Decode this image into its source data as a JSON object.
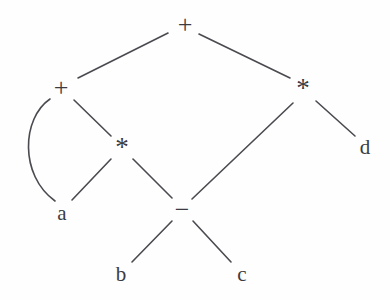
{
  "figure": {
    "background_color": "#fefefe",
    "edge_color": "#4a4a50",
    "label_color": "#3b3b42",
    "width": 390,
    "height": 300
  },
  "graph": {
    "type": "dag",
    "nodes": [
      {
        "id": "plus-root",
        "label": "+",
        "kind": "operator",
        "x": 185,
        "y": 25
      },
      {
        "id": "plus-left",
        "label": "+",
        "kind": "operator",
        "x": 61,
        "y": 88
      },
      {
        "id": "star-right",
        "label": "*",
        "kind": "operator",
        "x": 303,
        "y": 88
      },
      {
        "id": "star-mid",
        "label": "*",
        "kind": "operator",
        "x": 122,
        "y": 147
      },
      {
        "id": "minus",
        "label": "−",
        "kind": "operator",
        "x": 182,
        "y": 210
      },
      {
        "id": "leaf-a",
        "label": "a",
        "kind": "leaf",
        "x": 62,
        "y": 213
      },
      {
        "id": "leaf-b",
        "label": "b",
        "kind": "leaf",
        "x": 121,
        "y": 274
      },
      {
        "id": "leaf-c",
        "label": "c",
        "kind": "leaf",
        "x": 242,
        "y": 274
      },
      {
        "id": "leaf-d",
        "label": "d",
        "kind": "leaf",
        "x": 365,
        "y": 147
      }
    ],
    "edges": [
      {
        "id": "e-root-left",
        "from": "plus-root",
        "to": "plus-left",
        "shape": "line",
        "path": "M168,33 L78,78"
      },
      {
        "id": "e-root-right",
        "from": "plus-root",
        "to": "star-right",
        "shape": "line",
        "path": "M199,34 L290,78"
      },
      {
        "id": "e-left-a",
        "from": "plus-left",
        "to": "leaf-a",
        "shape": "curve",
        "path": "M50,99 C22,118 19,175 55,201"
      },
      {
        "id": "e-left-star",
        "from": "plus-left",
        "to": "star-mid",
        "shape": "line",
        "path": "M74,100 L111,136"
      },
      {
        "id": "e-star-a",
        "from": "star-mid",
        "to": "leaf-a",
        "shape": "line",
        "path": "M111,159 L72,200"
      },
      {
        "id": "e-star-minus",
        "from": "star-mid",
        "to": "minus",
        "shape": "line",
        "path": "M133,159 L172,198"
      },
      {
        "id": "e-starR-minus",
        "from": "star-right",
        "to": "minus",
        "shape": "line",
        "path": "M293,103 L192,199"
      },
      {
        "id": "e-starR-d",
        "from": "star-right",
        "to": "leaf-d",
        "shape": "line",
        "path": "M316,101 L355,136"
      },
      {
        "id": "e-minus-b",
        "from": "minus",
        "to": "leaf-b",
        "shape": "line",
        "path": "M172,221 L132,262"
      },
      {
        "id": "e-minus-c",
        "from": "minus",
        "to": "leaf-c",
        "shape": "line",
        "path": "M193,221 L231,262"
      }
    ]
  }
}
